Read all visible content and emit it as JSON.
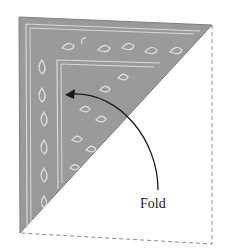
{
  "diagram": {
    "label": "Fold",
    "colors": {
      "fabric": "#9a9a9a",
      "fabric_edge": "#7f7f7f",
      "pattern": "#d8d8d8",
      "dashed_outline": "#8a8a8a",
      "arrow": "#1a1a1a",
      "background": "#ffffff"
    },
    "elements": [
      {
        "type": "folded-triangle",
        "vertices": [
          [
            19,
            17
          ],
          [
            212,
            25
          ],
          [
            20,
            233
          ]
        ]
      },
      {
        "type": "dashed-outline",
        "description": "unfolded half of square"
      },
      {
        "type": "curved-arrow",
        "from": [
          158,
          190
        ],
        "to": [
          66,
          95
        ]
      }
    ]
  }
}
